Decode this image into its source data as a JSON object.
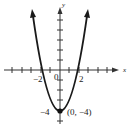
{
  "figure": {
    "type": "function-graph",
    "equation": "y = x^2 - 4",
    "axes": {
      "x_label": "x",
      "y_label": "y",
      "x_tick_labels": [
        "-2",
        "0",
        "2"
      ],
      "y_tick_labels": [
        "-4"
      ]
    },
    "annotations": {
      "vertex_label": "(0, −4)",
      "vertex": [
        0,
        -4
      ],
      "neg_two": "−2",
      "two": "2",
      "zero": "0",
      "neg_four": "−4"
    },
    "colors": {
      "curve": "#1a1a1a",
      "axes": "#333333",
      "background": "#ffffff"
    }
  }
}
